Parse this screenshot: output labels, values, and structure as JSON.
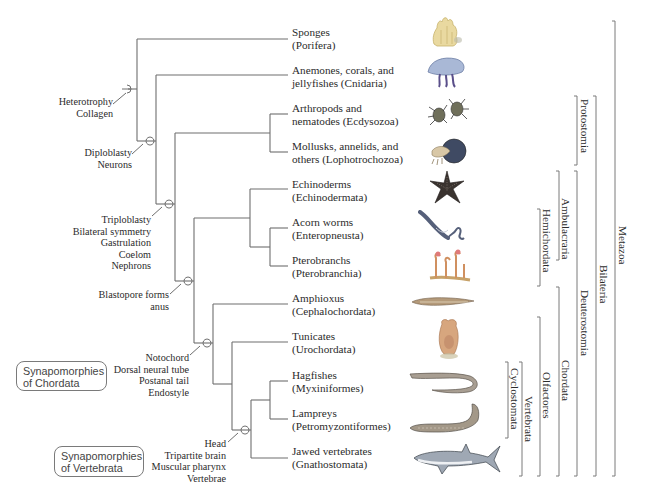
{
  "figure": {
    "type": "phylogenetic-tree",
    "taxa": [
      {
        "common": "Sponges",
        "scientific": "(Porifera)"
      },
      {
        "common": "Anemones, corals, and",
        "scientific": "jellyfishes (Cnidaria)"
      },
      {
        "common": "Arthropods and",
        "scientific": "nematodes (Ecdysozoa)"
      },
      {
        "common": "Mollusks, annelids, and",
        "scientific": "others (Lophotrochozoa)"
      },
      {
        "common": "Echinoderms",
        "scientific": "(Echinodermata)"
      },
      {
        "common": "Acorn worms",
        "scientific": "(Enteropneusta)"
      },
      {
        "common": "Pterobranchs",
        "scientific": "(Pterobranchia)"
      },
      {
        "common": "Amphioxus",
        "scientific": "(Cephalochordata)"
      },
      {
        "common": "Tunicates",
        "scientific": "(Urochordata)"
      },
      {
        "common": "Hagfishes",
        "scientific": "(Myxiniformes)"
      },
      {
        "common": "Lampreys",
        "scientific": "(Petromyzontiformes)"
      },
      {
        "common": "Jawed vertebrates",
        "scientific": "(Gnathostomata)"
      }
    ],
    "synapomorphies": [
      {
        "node": "metazoa",
        "lines": [
          "Heterotrophy",
          "Collagen"
        ]
      },
      {
        "node": "eumetazoa",
        "lines": [
          "Diploblasty",
          "Neurons"
        ]
      },
      {
        "node": "bilateria",
        "lines": [
          "Triploblasty",
          "Bilateral symmetry",
          "Gastrulation",
          "Coelom",
          "Nephrons"
        ]
      },
      {
        "node": "deuterostomia",
        "lines": [
          "Blastopore forms",
          "anus"
        ]
      },
      {
        "node": "chordata",
        "lines": [
          "Notochord",
          "Dorsal neural tube",
          "Postanal tail",
          "Endostyle"
        ]
      },
      {
        "node": "vertebrata",
        "lines": [
          "Head",
          "Tripartite brain",
          "Muscular pharynx",
          "Vertebrae"
        ]
      }
    ],
    "boxes": [
      {
        "line1": "Synapomorphies",
        "line2": "of Chordata"
      },
      {
        "line1": "Synapomorphies",
        "line2": "of Vertebrata"
      }
    ],
    "clades": [
      {
        "name": "Protostomia"
      },
      {
        "name": "Ambulacraria"
      },
      {
        "name": "Hemichordata"
      },
      {
        "name": "Deuterostomia"
      },
      {
        "name": "Chordata"
      },
      {
        "name": "Olfactores"
      },
      {
        "name": "Vertebrata"
      },
      {
        "name": "Cyclostomata"
      },
      {
        "name": "Bilateria"
      },
      {
        "name": "Metazoa"
      }
    ],
    "animal_icons": [
      "sponge-icon",
      "jellyfish-icon",
      "spider-icon",
      "nautilus-icon",
      "starfish-icon",
      "acorn-worm-icon",
      "pterobranch-icon",
      "amphioxus-icon",
      "tunicate-icon",
      "hagfish-icon",
      "lamprey-icon",
      "shark-icon"
    ],
    "colors": {
      "line": "#6e6e6e",
      "text": "#2b2b2b",
      "box_border": "#7a7a7a"
    }
  }
}
